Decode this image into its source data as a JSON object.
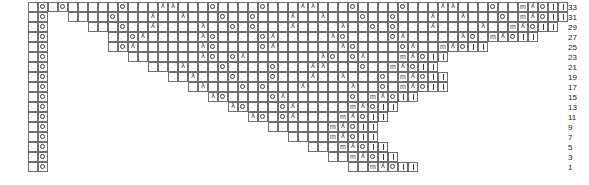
{
  "chart": {
    "type": "knitting-chart",
    "cell_width": 10,
    "cell_height": 10,
    "grid_origin_x": 28,
    "grid_origin_y": 2,
    "total_columns": 50,
    "rows_count": 17,
    "row_numbers": [
      33,
      31,
      29,
      27,
      25,
      23,
      21,
      19,
      17,
      15,
      13,
      11,
      9,
      7,
      5,
      3,
      1
    ],
    "rownum_x": 568,
    "legend_symbols": {
      "o": "yarn-over",
      "|": "knit",
      "/": "decrease-left-leaning",
      "\\": "decrease-right-leaning",
      "m": "make-one",
      ".": "empty-cell",
      " ": "no-stitch"
    },
    "edge_left_columns": [
      ".",
      "o"
    ],
    "edge_right_columns": [
      "/",
      "o",
      "|",
      "|"
    ],
    "grid": [
      {
        "row": 33,
        "start_col": 0,
        "cells": [
          ".",
          "o",
          ".",
          ".",
          ".",
          ".",
          ".",
          "o",
          ".",
          ".",
          ".",
          "/",
          "\\",
          ".",
          ".",
          ".",
          "o",
          ".",
          ".",
          ".",
          ".",
          "o",
          ".",
          ".",
          ".",
          "/",
          "\\",
          ".",
          ".",
          ".",
          "o",
          ".",
          ".",
          ".",
          ".",
          "o",
          ".",
          ".",
          ".",
          "/",
          "\\",
          ".",
          ".",
          ".",
          "o",
          ".",
          ".",
          "m",
          "/",
          "o",
          "|",
          "|"
        ]
      },
      {
        "row": 31,
        "start_col": 2,
        "cells": [
          ".",
          ".",
          ".",
          ".",
          "o",
          ".",
          ".",
          ".",
          "/",
          ".",
          ".",
          "\\",
          ".",
          ".",
          ".",
          "o",
          ".",
          ".",
          "o",
          ".",
          ".",
          ".",
          "/",
          ".",
          ".",
          "\\",
          ".",
          ".",
          ".",
          "o",
          ".",
          ".",
          "o",
          ".",
          ".",
          ".",
          "/",
          ".",
          ".",
          "\\",
          ".",
          ".",
          ".",
          "o",
          ".",
          "m",
          "/",
          "o",
          "|",
          "|"
        ]
      },
      {
        "row": 29,
        "start_col": 4,
        "cells": [
          ".",
          ".",
          ".",
          "o",
          ".",
          ".",
          "/",
          ".",
          ".",
          ".",
          ".",
          "\\",
          ".",
          ".",
          "o",
          ".",
          "o",
          ".",
          ".",
          ".",
          "/",
          ".",
          ".",
          ".",
          ".",
          "\\",
          ".",
          ".",
          "o",
          ".",
          "o",
          ".",
          ".",
          ".",
          "/",
          ".",
          ".",
          ".",
          ".",
          "\\",
          ".",
          ".",
          "m",
          "/",
          "o",
          "|",
          "|"
        ]
      },
      {
        "row": 27,
        "start_col": 6,
        "cells": [
          ".",
          ".",
          "o",
          "/",
          ".",
          ".",
          ".",
          ".",
          ".",
          "\\",
          "o",
          ".",
          ".",
          ".",
          ".",
          "o",
          "/",
          ".",
          ".",
          ".",
          ".",
          ".",
          "\\",
          "o",
          ".",
          ".",
          ".",
          ".",
          "o",
          "/",
          ".",
          ".",
          ".",
          ".",
          ".",
          "\\",
          "o",
          ".",
          "m",
          "/",
          "o",
          "|",
          "|"
        ]
      },
      {
        "row": 25,
        "start_col": 6,
        "cells": [
          ".",
          "o",
          "/",
          ".",
          ".",
          ".",
          ".",
          ".",
          ".",
          "\\",
          "o",
          ".",
          ".",
          ".",
          ".",
          "o",
          "/",
          ".",
          ".",
          ".",
          ".",
          ".",
          ".",
          "\\",
          "o",
          ".",
          ".",
          ".",
          ".",
          "o",
          "/",
          ".",
          ".",
          "m",
          "/",
          "o",
          "|",
          "|"
        ]
      },
      {
        "row": 23,
        "start_col": 8,
        "cells": [
          ".",
          ".",
          ".",
          ".",
          ".",
          ".",
          ".",
          "\\",
          "o",
          ".",
          "o",
          "/",
          ".",
          ".",
          ".",
          ".",
          ".",
          ".",
          ".",
          "\\",
          "o",
          ".",
          "o",
          "/",
          ".",
          ".",
          ".",
          "m",
          "/",
          "o",
          "|",
          "|"
        ]
      },
      {
        "row": 21,
        "start_col": 10,
        "cells": [
          ".",
          ".",
          ".",
          "\\",
          ".",
          ".",
          ".",
          "o",
          ".",
          ".",
          ".",
          ".",
          "o",
          ".",
          ".",
          ".",
          "/",
          "\\",
          ".",
          ".",
          ".",
          "o",
          ".",
          ".",
          "m",
          "/",
          "o",
          "|",
          "|"
        ]
      },
      {
        "row": 19,
        "start_col": 12,
        "cells": [
          ".",
          ".",
          "\\",
          ".",
          ".",
          ".",
          "o",
          ".",
          ".",
          ".",
          "o",
          ".",
          ".",
          ".",
          "/",
          ".",
          ".",
          "\\",
          ".",
          ".",
          ".",
          "o",
          ".",
          "m",
          "/",
          "o",
          "|",
          "|"
        ]
      },
      {
        "row": 17,
        "start_col": 14,
        "cells": [
          ".",
          "\\",
          ".",
          ".",
          ".",
          "o",
          ".",
          "o",
          ".",
          ".",
          ".",
          "/",
          ".",
          ".",
          ".",
          ".",
          "\\",
          ".",
          ".",
          "o",
          ".",
          "m",
          "/",
          "o",
          "|",
          "|"
        ]
      },
      {
        "row": 15,
        "start_col": 16,
        "cells": [
          "\\",
          "o",
          ".",
          ".",
          ".",
          ".",
          "o",
          "/",
          ".",
          ".",
          ".",
          ".",
          ".",
          ".",
          "o",
          ".",
          "m",
          "/",
          "o",
          "|",
          "|"
        ]
      },
      {
        "row": 13,
        "start_col": 18,
        "cells": [
          "\\",
          "o",
          ".",
          ".",
          ".",
          "o",
          "/",
          ".",
          ".",
          ".",
          ".",
          ".",
          "m",
          "/",
          "o",
          "|",
          "|"
        ]
      },
      {
        "row": 11,
        "start_col": 20,
        "cells": [
          "\\",
          "o",
          ".",
          "o",
          "/",
          ".",
          ".",
          ".",
          ".",
          "m",
          "/",
          "o",
          "|",
          "|"
        ]
      },
      {
        "row": 9,
        "start_col": 22,
        "cells": [
          ".",
          ".",
          ".",
          ".",
          ".",
          ".",
          "m",
          "/",
          "o",
          "|",
          "|"
        ]
      },
      {
        "row": 7,
        "start_col": 24,
        "cells": [
          ".",
          ".",
          ".",
          ".",
          "m",
          "/",
          "o",
          "|",
          "|"
        ]
      },
      {
        "row": 5,
        "start_col": 26,
        "cells": [
          ".",
          ".",
          ".",
          "m",
          "/",
          "o",
          "|",
          "|"
        ]
      },
      {
        "row": 3,
        "start_col": 28,
        "cells": [
          ".",
          ".",
          "m",
          "/",
          "o",
          "|",
          "|"
        ]
      },
      {
        "row": 1,
        "start_col": 30,
        "cells": [
          ".",
          ".",
          "m",
          "/",
          "o",
          "|",
          "|"
        ]
      }
    ],
    "left_edge": {
      "rows": 17,
      "columns": [
        {
          "name": "blank-col",
          "symbol": "."
        },
        {
          "name": "yarnover-col",
          "symbol": "o"
        }
      ],
      "x": 28
    }
  }
}
